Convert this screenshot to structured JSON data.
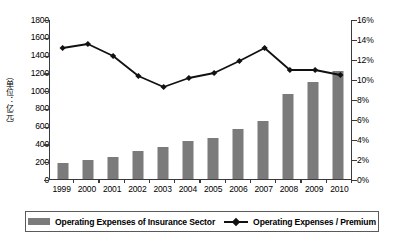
{
  "chart_data": {
    "type": "bar",
    "title": "",
    "subtitle": "",
    "xlabel": "",
    "ylabel": "（单位：亿元）",
    "y2label": "",
    "grid": false,
    "legend_position": "bottom",
    "categories": [
      "1999",
      "2000",
      "2001",
      "2002",
      "2003",
      "2004",
      "2005",
      "2006",
      "2007",
      "2008",
      "2009",
      "2010"
    ],
    "series": [
      {
        "name": "Operating Expenses of Insurance Sector",
        "type": "bar",
        "axis": "left",
        "unit": "亿元",
        "color": "#7b7b7b",
        "values": [
          175,
          210,
          250,
          310,
          355,
          430,
          465,
          560,
          655,
          960,
          1090,
          1210
        ]
      },
      {
        "name": "Operating Expenses / Premium",
        "type": "line",
        "axis": "right",
        "unit": "%",
        "color": "#111111",
        "marker": "diamond",
        "values": [
          13.2,
          13.6,
          12.4,
          10.4,
          9.3,
          10.2,
          10.7,
          11.9,
          13.2,
          11.0,
          11.0,
          10.5
        ]
      }
    ],
    "left_axis": {
      "min": 0,
      "max": 1800,
      "step": 200,
      "ticks": [
        "0",
        "200",
        "400",
        "600",
        "800",
        "1000",
        "1200",
        "1400",
        "1600",
        "1800"
      ]
    },
    "right_axis": {
      "min": 0,
      "max": 16,
      "step": 2,
      "ticks": [
        "0%",
        "2%",
        "4%",
        "6%",
        "8%",
        "10%",
        "12%",
        "14%",
        "16%"
      ]
    }
  },
  "legend": {
    "bar_label": "Operating Expenses of Insurance Sector",
    "line_label": "Operating Expenses / Premium"
  }
}
